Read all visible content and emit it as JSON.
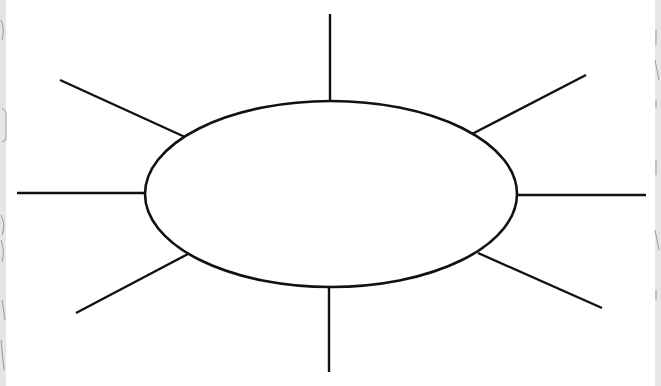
{
  "diagram": {
    "type": "spider-map",
    "colors": {
      "background": "#ffffff",
      "stroke": "#111111",
      "edge_strip": "#e6e6e6"
    },
    "center": {
      "label": "",
      "cx": 331,
      "cy": 194,
      "rx": 186,
      "ry": 93
    },
    "spokes": [
      {
        "id": "top",
        "label": "",
        "x1": 330,
        "y1": 14,
        "x2": 330,
        "y2": 101
      },
      {
        "id": "upper-right",
        "label": "",
        "x1": 472,
        "y1": 134,
        "x2": 586,
        "y2": 75
      },
      {
        "id": "right",
        "label": "",
        "x1": 517,
        "y1": 195,
        "x2": 646,
        "y2": 195
      },
      {
        "id": "lower-right",
        "label": "",
        "x1": 478,
        "y1": 253,
        "x2": 602,
        "y2": 308
      },
      {
        "id": "bottom",
        "label": "",
        "x1": 329,
        "y1": 287,
        "x2": 329,
        "y2": 372
      },
      {
        "id": "lower-left",
        "label": "",
        "x1": 188,
        "y1": 254,
        "x2": 76,
        "y2": 313
      },
      {
        "id": "left",
        "label": "",
        "x1": 146,
        "y1": 193,
        "x2": 17,
        "y2": 193
      },
      {
        "id": "upper-left",
        "label": "",
        "x1": 185,
        "y1": 137,
        "x2": 60,
        "y2": 80
      }
    ]
  }
}
